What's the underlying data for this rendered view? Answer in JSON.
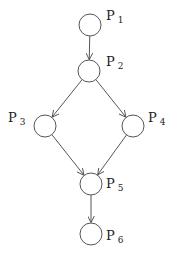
{
  "diagram": {
    "type": "directed-acyclic-graph",
    "stroke_color": "#555555",
    "node_radius": 11,
    "nodes": [
      {
        "id": "p1",
        "label": "P",
        "subscript": "1",
        "cx": 90,
        "cy": 25,
        "lx": 106,
        "ly": 20
      },
      {
        "id": "p2",
        "label": "P",
        "subscript": "2",
        "cx": 89,
        "cy": 71,
        "lx": 106,
        "ly": 66
      },
      {
        "id": "p3",
        "label": "P",
        "subscript": "3",
        "cx": 45,
        "cy": 126,
        "lx": 8,
        "ly": 122
      },
      {
        "id": "p4",
        "label": "P",
        "subscript": "4",
        "cx": 133,
        "cy": 126,
        "lx": 148,
        "ly": 122
      },
      {
        "id": "p5",
        "label": "P",
        "subscript": "5",
        "cx": 91,
        "cy": 184,
        "lx": 106,
        "ly": 188
      },
      {
        "id": "p6",
        "label": "P",
        "subscript": "6",
        "cx": 91,
        "cy": 234,
        "lx": 106,
        "ly": 240
      }
    ],
    "edges": [
      {
        "from": "p1",
        "to": "p2"
      },
      {
        "from": "p2",
        "to": "p3"
      },
      {
        "from": "p2",
        "to": "p4"
      },
      {
        "from": "p3",
        "to": "p5"
      },
      {
        "from": "p4",
        "to": "p5"
      },
      {
        "from": "p5",
        "to": "p6"
      }
    ]
  }
}
